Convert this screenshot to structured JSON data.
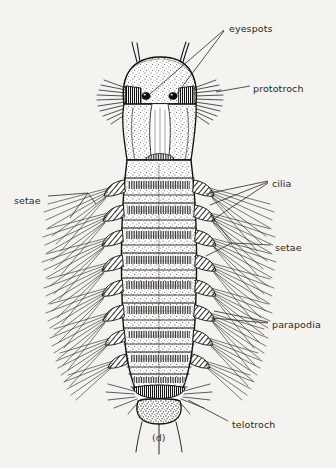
{
  "figure": {
    "caption": "(d)",
    "background_color": "#f4f3f0",
    "ink_color": "#1a1a1a",
    "label_color": "#2a2724"
  },
  "labels": [
    {
      "id": "eyespots",
      "text": "eyespots",
      "x": 229,
      "y": 23
    },
    {
      "id": "prototroch",
      "text": "prototroch",
      "x": 253,
      "y": 83
    },
    {
      "id": "setae_left",
      "text": "setae",
      "x": 14,
      "y": 195
    },
    {
      "id": "cilia",
      "text": "cilia",
      "x": 272,
      "y": 178
    },
    {
      "id": "setae_right",
      "text": "setae",
      "x": 275,
      "y": 242
    },
    {
      "id": "parapodia",
      "text": "parapodia",
      "x": 272,
      "y": 319
    },
    {
      "id": "telotroch",
      "text": "telotroch",
      "x": 232,
      "y": 419
    }
  ],
  "anatomy": {
    "head": {
      "name": "prostomium",
      "eyespot_count": 2,
      "antenna_count": 2
    },
    "trunk": {
      "name": "segmented trunk",
      "segment_count": 9
    },
    "pygidium": {
      "name": "pygidium",
      "anal_cirri_count": 3
    },
    "ciliary_bands": [
      "prototroch",
      "telotroch"
    ],
    "appendages": [
      "parapodia",
      "setae",
      "cilia"
    ]
  }
}
